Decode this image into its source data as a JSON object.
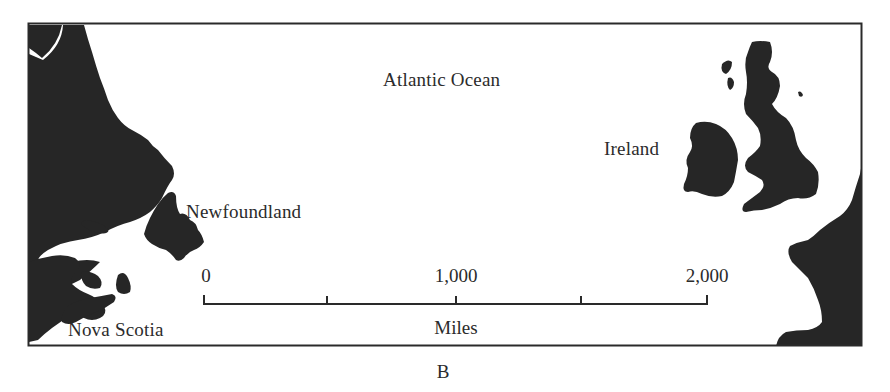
{
  "map": {
    "title": "Atlantic Ocean",
    "caption": "B",
    "colors": {
      "land": "#262626",
      "water": "#ffffff",
      "frame": "#2a2a2a",
      "text": "#2b2b2b"
    },
    "labels": {
      "ocean": "Atlantic Ocean",
      "ireland": "Ireland",
      "newfoundland": "Newfoundland",
      "nova_scotia": "Nova Scotia"
    },
    "scale_bar": {
      "unit": "Miles",
      "ticks": [
        {
          "value": "0",
          "x": 204
        },
        {
          "value": "",
          "x": 327
        },
        {
          "value": "1,000",
          "x": 456
        },
        {
          "value": "",
          "x": 581
        },
        {
          "value": "2,000",
          "x": 707
        }
      ],
      "tick_labels": [
        "0",
        "1,000",
        "2,000"
      ]
    }
  }
}
